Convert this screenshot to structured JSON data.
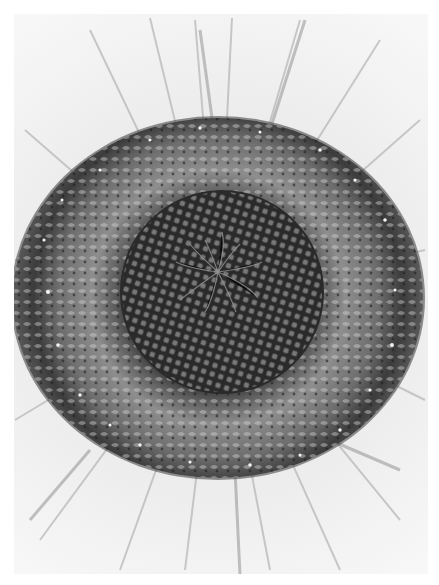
{
  "image": {
    "subject": "Sunflower head close-up",
    "style": "grayscale photograph",
    "alt": "Black-and-white close-up photograph of a sunflower head showing spiral floret pattern surrounded by white petals"
  },
  "regions": {
    "petals": {
      "label": "Ray petals",
      "color": "#efefef",
      "shadow": "#9a9a9a"
    },
    "outer_rim": {
      "label": "Outer floret ring",
      "color": "#3a3a3a",
      "pollen": "#f2f2f2"
    },
    "middle_ring": {
      "label": "Middle floret ring",
      "color": "#8a8a8a"
    },
    "inner_disc": {
      "label": "Inner seed disc with spiral florets",
      "color": "#2c2c2c"
    },
    "center": {
      "label": "Center with radiating styles",
      "color": "#222222"
    }
  },
  "colors": {
    "background": "#ffffff",
    "frame": "#f4f4f4",
    "petal_streak": "#b0b0b0",
    "dark": "#1e1e1e",
    "mid": "#7d7d7d",
    "light": "#cfcfcf"
  }
}
